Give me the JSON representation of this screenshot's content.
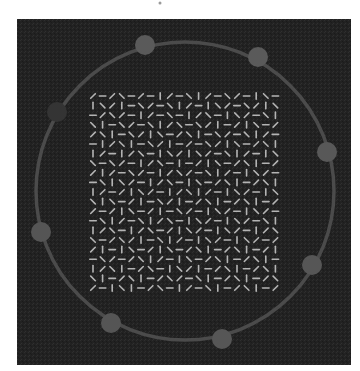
{
  "canvas": {
    "width": 360,
    "height": 371,
    "background": "#ffffff"
  },
  "panel": {
    "x": 17,
    "y": 19,
    "width": 334,
    "height": 346,
    "color": "#222222",
    "noise_color": "#2e2e2e"
  },
  "top_mark": {
    "x": 160,
    "y": 3,
    "color": "#9a9a9a"
  },
  "ring": {
    "cx": 185,
    "cy": 191,
    "r": 149,
    "stroke": "#4b4b4b",
    "stroke_width": 3.5
  },
  "dots": [
    {
      "name": "dot-top-left",
      "cx": 145,
      "cy": 45,
      "r": 10,
      "fill": "#5a5a5a"
    },
    {
      "name": "dot-top-right",
      "cx": 258,
      "cy": 57,
      "r": 10,
      "fill": "#5a5a5a"
    },
    {
      "name": "dot-right",
      "cx": 327,
      "cy": 152,
      "r": 10,
      "fill": "#585858"
    },
    {
      "name": "dot-right-lower",
      "cx": 312,
      "cy": 265,
      "r": 10,
      "fill": "#565656"
    },
    {
      "name": "dot-bottom",
      "cx": 222,
      "cy": 339,
      "r": 10,
      "fill": "#565656"
    },
    {
      "name": "dot-bottom-left",
      "cx": 111,
      "cy": 323,
      "r": 10,
      "fill": "#555555"
    },
    {
      "name": "dot-left",
      "cx": 41,
      "cy": 232,
      "r": 10,
      "fill": "#555555"
    },
    {
      "name": "dot-left-upper",
      "cx": 57,
      "cy": 112,
      "r": 10,
      "fill": "#343434"
    }
  ],
  "grid": {
    "x0": 93,
    "y0": 96,
    "cols": 20,
    "rows": 21,
    "dx": 9.6,
    "dy": 9.6,
    "seg_length": 6.5,
    "seg_width": 1.6,
    "color": "#b4b4b4",
    "angles": [
      [
        135,
        0,
        135,
        45,
        0,
        135,
        0,
        90,
        135,
        0,
        45,
        90,
        135,
        0,
        45,
        135,
        0,
        90,
        45,
        0
      ],
      [
        90,
        45,
        135,
        90,
        0,
        45,
        135,
        0,
        45,
        90,
        135,
        0,
        90,
        45,
        135,
        0,
        45,
        135,
        90,
        45
      ],
      [
        0,
        135,
        45,
        135,
        0,
        90,
        135,
        0,
        45,
        0,
        90,
        135,
        45,
        0,
        90,
        45,
        135,
        0,
        45,
        90
      ],
      [
        45,
        90,
        0,
        45,
        135,
        0,
        45,
        90,
        135,
        45,
        0,
        45,
        135,
        90,
        0,
        135,
        90,
        45,
        0,
        135
      ],
      [
        135,
        45,
        90,
        0,
        45,
        135,
        90,
        45,
        0,
        135,
        45,
        90,
        0,
        45,
        135,
        0,
        45,
        90,
        135,
        0
      ],
      [
        0,
        90,
        135,
        45,
        90,
        0,
        45,
        135,
        90,
        0,
        135,
        0,
        45,
        135,
        90,
        45,
        0,
        135,
        45,
        90
      ],
      [
        90,
        135,
        0,
        90,
        135,
        45,
        0,
        90,
        45,
        135,
        90,
        45,
        135,
        0,
        45,
        90,
        135,
        0,
        90,
        45
      ],
      [
        45,
        0,
        45,
        135,
        0,
        90,
        135,
        45,
        0,
        90,
        0,
        135,
        90,
        45,
        0,
        135,
        45,
        90,
        0,
        135
      ],
      [
        135,
        90,
        135,
        0,
        45,
        135,
        0,
        90,
        135,
        45,
        135,
        0,
        45,
        90,
        135,
        0,
        90,
        45,
        135,
        0
      ],
      [
        0,
        45,
        90,
        45,
        135,
        0,
        90,
        135,
        45,
        0,
        90,
        45,
        0,
        135,
        45,
        90,
        0,
        135,
        45,
        90
      ],
      [
        90,
        135,
        0,
        135,
        90,
        45,
        135,
        0,
        90,
        135,
        45,
        90,
        135,
        0,
        90,
        45,
        135,
        0,
        90,
        45
      ],
      [
        45,
        90,
        45,
        0,
        135,
        90,
        0,
        45,
        135,
        90,
        0,
        135,
        45,
        90,
        0,
        135,
        45,
        90,
        0,
        135
      ],
      [
        135,
        0,
        135,
        90,
        45,
        0,
        135,
        90,
        0,
        45,
        135,
        0,
        90,
        45,
        135,
        0,
        90,
        45,
        135,
        0
      ],
      [
        0,
        45,
        90,
        135,
        0,
        45,
        90,
        135,
        45,
        0,
        90,
        45,
        135,
        0,
        90,
        45,
        135,
        0,
        45,
        90
      ],
      [
        90,
        135,
        45,
        0,
        90,
        135,
        45,
        0,
        135,
        90,
        45,
        135,
        0,
        90,
        45,
        135,
        0,
        90,
        135,
        45
      ],
      [
        45,
        0,
        135,
        45,
        135,
        90,
        0,
        45,
        90,
        135,
        0,
        90,
        45,
        135,
        0,
        90,
        45,
        135,
        0,
        135
      ],
      [
        135,
        90,
        0,
        90,
        45,
        0,
        135,
        90,
        45,
        0,
        135,
        45,
        90,
        0,
        135,
        45,
        90,
        0,
        135,
        90
      ],
      [
        0,
        45,
        135,
        0,
        135,
        45,
        90,
        135,
        0,
        90,
        45,
        0,
        135,
        45,
        90,
        0,
        135,
        45,
        90,
        0
      ],
      [
        90,
        135,
        45,
        90,
        0,
        135,
        45,
        0,
        90,
        45,
        135,
        90,
        0,
        135,
        45,
        90,
        0,
        135,
        45,
        90
      ],
      [
        45,
        90,
        0,
        135,
        45,
        90,
        0,
        135,
        45,
        135,
        0,
        45,
        90,
        0,
        135,
        45,
        90,
        0,
        135,
        45
      ],
      [
        135,
        0,
        90,
        45,
        90,
        0,
        135,
        45,
        0,
        90,
        135,
        0,
        45,
        90,
        0,
        135,
        45,
        90,
        0,
        135
      ]
    ]
  }
}
